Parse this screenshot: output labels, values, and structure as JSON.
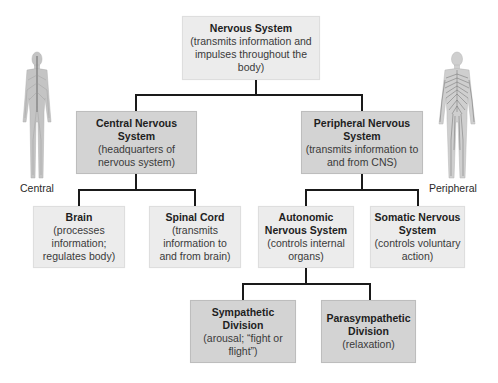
{
  "diagram": {
    "type": "hierarchy",
    "colors": {
      "light_box": "#ececec",
      "dark_box": "#d3d3d3",
      "connector": "#1a1a1a"
    },
    "root": {
      "title": "Nervous System",
      "desc": "(transmits information and impulses throughout the body)"
    },
    "cns": {
      "title": "Central Nervous System",
      "desc": "(headquarters of nervous system)"
    },
    "pns": {
      "title": "Peripheral Nervous System",
      "desc": "(transmits information to and from CNS)"
    },
    "brain": {
      "title": "Brain",
      "desc": "(processes information; regulates body)"
    },
    "spinal_cord": {
      "title": "Spinal Cord",
      "desc": "(transmits information to and from brain)"
    },
    "autonomic": {
      "title": "Autonomic Nervous System",
      "desc": "(controls internal organs)"
    },
    "somatic": {
      "title": "Somatic Nervous System",
      "desc": "(controls voluntary action)"
    },
    "sympathetic": {
      "title": "Sympathetic Division",
      "desc": "(arousal; “fight or flight”)"
    },
    "parasympathetic": {
      "title": "Parasympathetic Division",
      "desc": "(relaxation)"
    }
  },
  "figures": {
    "central_label": "Central",
    "peripheral_label": "Peripheral"
  }
}
